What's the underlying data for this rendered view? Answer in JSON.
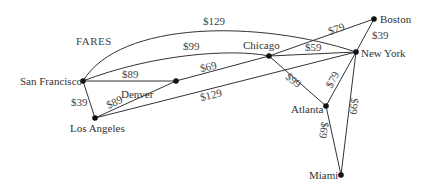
{
  "title": "FARES",
  "nodes": {
    "san_francisco": {
      "label": "San Francisco",
      "x": 83,
      "y": 81
    },
    "denver": {
      "label": "Denver",
      "x": 176,
      "y": 81
    },
    "chicago": {
      "label": "Chicago",
      "x": 269,
      "y": 56
    },
    "boston": {
      "label": "Boston",
      "x": 374,
      "y": 19
    },
    "new_york": {
      "label": "New York",
      "x": 356,
      "y": 52
    },
    "los_angeles": {
      "label": "Los Angeles",
      "x": 95,
      "y": 118
    },
    "atlanta": {
      "label": "Atlanta",
      "x": 326,
      "y": 106
    },
    "miami": {
      "label": "Miami",
      "x": 341,
      "y": 175
    }
  },
  "edges": [
    {
      "from": "San Francisco",
      "to": "New York",
      "fare": "$129"
    },
    {
      "from": "San Francisco",
      "to": "Chicago",
      "fare": "$99"
    },
    {
      "from": "San Francisco",
      "to": "Denver",
      "fare": "$89"
    },
    {
      "from": "San Francisco",
      "to": "Los Angeles",
      "fare": "$39"
    },
    {
      "from": "Denver",
      "to": "Chicago",
      "fare": "$69"
    },
    {
      "from": "Los Angeles",
      "to": "Denver",
      "fare": "$89"
    },
    {
      "from": "Los Angeles",
      "to": "New York",
      "fare": "$129"
    },
    {
      "from": "Chicago",
      "to": "Boston",
      "fare": "$79"
    },
    {
      "from": "Chicago",
      "to": "New York",
      "fare": "$59"
    },
    {
      "from": "Chicago",
      "to": "Atlanta",
      "fare": "$99"
    },
    {
      "from": "Boston",
      "to": "New York",
      "fare": "$39"
    },
    {
      "from": "New York",
      "to": "Atlanta",
      "fare": "$79"
    },
    {
      "from": "New York",
      "to": "Miami",
      "fare": "$99"
    },
    {
      "from": "Atlanta",
      "to": "Miami",
      "fare": "$69"
    }
  ]
}
